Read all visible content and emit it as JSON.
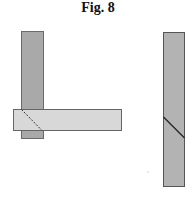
{
  "figure": {
    "title": "Fig. 8"
  },
  "colors": {
    "bar_dark": "#a9a9a9",
    "bar_light": "#d6d6d6",
    "outline": "#555555"
  }
}
